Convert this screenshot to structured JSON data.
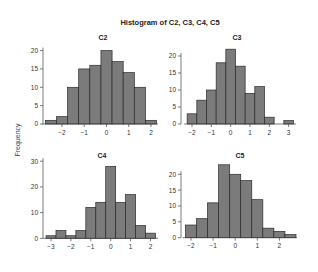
{
  "figure": {
    "title": "Histogram of C2, C3, C4, C5",
    "ylabel": "Frequency"
  },
  "style": {
    "bar_fill": "#7b7b7b",
    "bar_stroke": "#2a2a2a",
    "axis_color": "#444444",
    "text_color": "#333333"
  },
  "chart_data": [
    {
      "type": "bar",
      "title": "C2",
      "xlabel": "",
      "ylabel": "Frequency",
      "bin_width": 0.5,
      "bin_start": -2.75,
      "values": [
        1,
        2,
        10,
        15,
        16,
        20,
        17,
        14,
        10,
        1
      ],
      "xticks": [
        -2,
        -1,
        0,
        1,
        2
      ],
      "yticks": [
        0,
        5,
        10,
        15,
        20
      ],
      "xlim": [
        -2.75,
        2.25
      ],
      "ylim": [
        0,
        20
      ]
    },
    {
      "type": "bar",
      "title": "C3",
      "xlabel": "",
      "ylabel": "Frequency",
      "bin_width": 0.5,
      "bin_start": -2.25,
      "values": [
        3,
        7,
        10,
        18,
        22,
        17,
        9,
        11,
        2,
        0,
        1
      ],
      "xticks": [
        -2,
        -1,
        0,
        1,
        2,
        3
      ],
      "yticks": [
        0,
        5,
        10,
        15,
        20
      ],
      "xlim": [
        -2.25,
        3.25
      ],
      "ylim": [
        0,
        22
      ]
    },
    {
      "type": "bar",
      "title": "C4",
      "xlabel": "",
      "ylabel": "Frequency",
      "bin_width": 0.5,
      "bin_start": -3.25,
      "values": [
        1,
        3,
        1,
        3,
        12,
        14,
        28,
        14,
        17,
        5,
        2
      ],
      "xticks": [
        -3,
        -2,
        -1,
        0,
        1,
        2
      ],
      "yticks": [
        0,
        10,
        20,
        30
      ],
      "xlim": [
        -3.25,
        2.25
      ],
      "ylim": [
        0,
        30
      ]
    },
    {
      "type": "bar",
      "title": "C5",
      "xlabel": "",
      "ylabel": "Frequency",
      "bin_width": 0.5,
      "bin_start": -2.25,
      "values": [
        4,
        6,
        11,
        23,
        20,
        18,
        12,
        3,
        2,
        1
      ],
      "xticks": [
        -2,
        -1,
        0,
        1,
        2
      ],
      "yticks": [
        0,
        5,
        10,
        15,
        20
      ],
      "xlim": [
        -2.25,
        2.75
      ],
      "ylim": [
        0,
        23
      ]
    }
  ]
}
